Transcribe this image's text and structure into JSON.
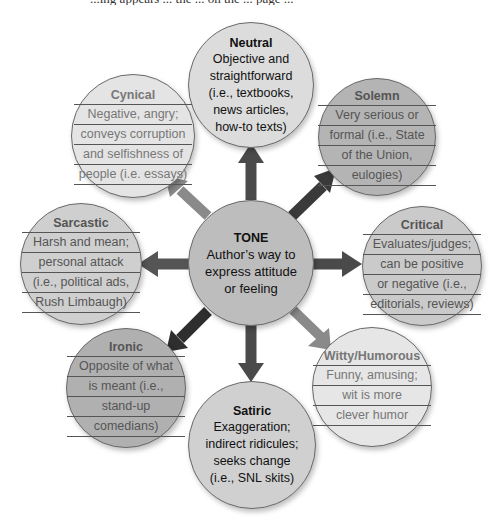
{
  "header": {
    "cutoff_text": "...ing appears ... the ... on the ... page ..."
  },
  "center": {
    "title": "TONE",
    "lines": [
      "Author’s way to",
      "express attitude",
      "or feeling"
    ],
    "color": "#bdbdbd"
  },
  "nodes": [
    {
      "id": "neutral",
      "title": "Neutral",
      "lines": [
        "Objective and",
        "straightforward",
        "(i.e., textbooks,",
        "news articles,",
        "how-to texts)"
      ],
      "fill": "#dcdcdc",
      "arrow_color": "#4a4a4a"
    },
    {
      "id": "solemn",
      "title": "Solemn",
      "lines": [
        "Very serious or",
        "formal (i.e., State",
        "of the Union,",
        "eulogies)"
      ],
      "fill": "#b4b4b4",
      "arrow_color": "#3a3a3a"
    },
    {
      "id": "critical",
      "title": "Critical",
      "lines": [
        "Evaluates/judges;",
        "can be positive",
        "or negative (i.e.,",
        "editorials, reviews)"
      ],
      "fill": "#cacaca",
      "arrow_color": "#4a4a4a"
    },
    {
      "id": "witty",
      "title": "Witty/Humorous",
      "lines": [
        "Funny, amusing;",
        "wit is more",
        "clever humor"
      ],
      "fill": "#e6e6e6",
      "arrow_color": "#8a8a8a"
    },
    {
      "id": "satiric",
      "title": "Satiric",
      "lines": [
        "Exaggeration;",
        "indirect ridicules;",
        "seeks change",
        "(i.e., SNL skits)"
      ],
      "fill": "#d0d0d0",
      "arrow_color": "#4a4a4a"
    },
    {
      "id": "ironic",
      "title": "Ironic",
      "lines": [
        "Opposite of what",
        "is meant (i.e.,",
        "stand-up",
        "comedians)"
      ],
      "fill": "#b0b0b0",
      "arrow_color": "#2e2e2e"
    },
    {
      "id": "sarcastic",
      "title": "Sarcastic",
      "lines": [
        "Harsh and mean;",
        "personal attack",
        "(i.e., political ads,",
        "Rush Limbaugh)"
      ],
      "fill": "#cfcfcf",
      "arrow_color": "#555555"
    },
    {
      "id": "cynical",
      "title": "Cynical",
      "lines": [
        "Negative, angry;",
        "conveys corruption",
        "and selfishness of",
        "people (i.e. essays)"
      ],
      "fill": "#e4e4e4",
      "arrow_color": "#8a8a8a"
    }
  ]
}
